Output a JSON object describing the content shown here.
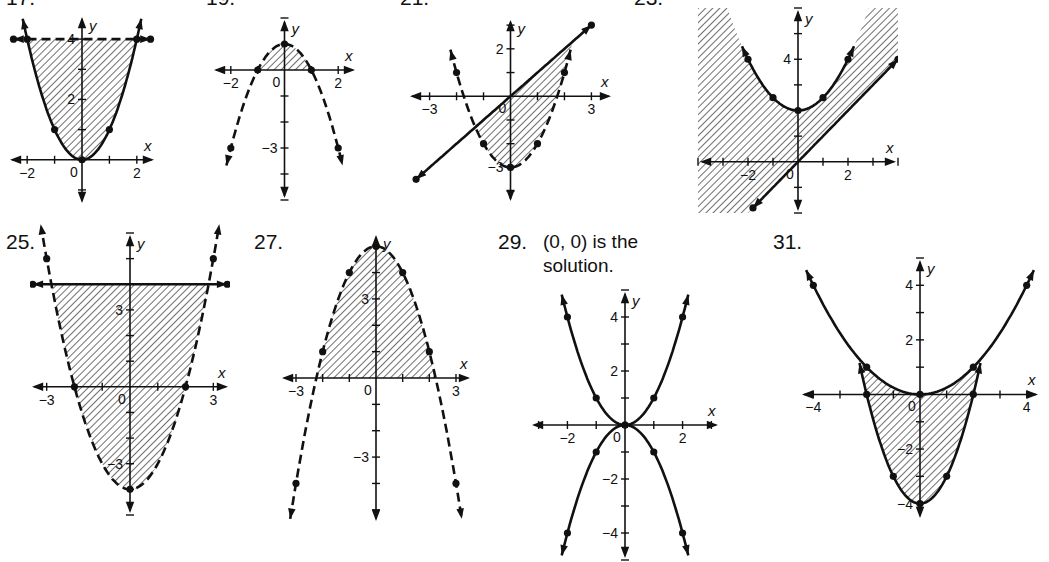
{
  "chart_data": [
    {
      "id": "17",
      "label": "17.",
      "type": "line",
      "title": "",
      "xlabel": "x",
      "ylabel": "y",
      "x_ticks": [
        "-2",
        "0",
        "2"
      ],
      "y_ticks": [
        "2",
        "4"
      ],
      "xlim": [
        -2.7,
        2.7
      ],
      "ylim": [
        -1.5,
        4.8
      ],
      "series": [
        {
          "name": "y = x^2",
          "style": "solid",
          "points": [
            [
              -2,
              4
            ],
            [
              -1,
              1
            ],
            [
              0,
              0
            ],
            [
              1,
              1
            ],
            [
              2,
              4
            ]
          ]
        },
        {
          "name": "y = 4",
          "style": "dashed",
          "points": [
            [
              -2.5,
              4
            ],
            [
              2.5,
              4
            ]
          ]
        }
      ],
      "shaded": "between parabola and y=4",
      "grid": false
    },
    {
      "id": "19",
      "label": "19.",
      "type": "line",
      "xlabel": "x",
      "ylabel": "y",
      "x_ticks": [
        "-2",
        "0",
        "2"
      ],
      "y_ticks": [
        "-3"
      ],
      "xlim": [
        -2.7,
        2.7
      ],
      "ylim": [
        -5,
        2
      ],
      "series": [
        {
          "name": "y = 1 - x^2",
          "style": "dashed",
          "points": [
            [
              -2,
              -3
            ],
            [
              -1,
              0
            ],
            [
              0,
              1
            ],
            [
              1,
              0
            ],
            [
              2,
              -3
            ]
          ]
        }
      ],
      "shaded": "between parabola and x-axis (above)",
      "grid": false
    },
    {
      "id": "21",
      "label": "21.",
      "type": "line",
      "xlabel": "x",
      "ylabel": "y",
      "x_ticks": [
        "-3",
        "0",
        "3"
      ],
      "y_ticks": [
        "2",
        "-3"
      ],
      "xlim": [
        -3.8,
        3.8
      ],
      "ylim": [
        -4.5,
        3.3
      ],
      "series": [
        {
          "name": "y = x^2 - 3",
          "style": "dashed",
          "points": [
            [
              -2,
              1
            ],
            [
              -1,
              -2
            ],
            [
              0,
              -3
            ],
            [
              1,
              -2
            ],
            [
              2,
              1
            ]
          ]
        },
        {
          "name": "y = x",
          "style": "solid/dashed",
          "points": [
            [
              -3.5,
              -3.5
            ],
            [
              3,
              3
            ]
          ]
        }
      ],
      "shaded": "above parabola, below line",
      "grid": false
    },
    {
      "id": "23",
      "label": "23.",
      "type": "line",
      "xlabel": "x",
      "ylabel": "y",
      "x_ticks": [
        "-2",
        "0",
        "2"
      ],
      "y_ticks": [
        "4"
      ],
      "xlim": [
        -4,
        4
      ],
      "ylim": [
        -2,
        6
      ],
      "series": [
        {
          "name": "y = x^2/2 + 2",
          "style": "solid",
          "points": [
            [
              -2,
              4
            ],
            [
              -1,
              2.5
            ],
            [
              0,
              2
            ],
            [
              1,
              2.5
            ],
            [
              2,
              4
            ]
          ]
        },
        {
          "name": "y = x",
          "style": "solid",
          "points": [
            [
              -1.8,
              -1.8
            ],
            [
              4,
              4
            ]
          ]
        }
      ],
      "shaded": "outside parabola and above line (large region)",
      "grid": false
    },
    {
      "id": "25",
      "label": "25.",
      "type": "line",
      "xlabel": "x",
      "ylabel": "y",
      "x_ticks": [
        "-3",
        "0",
        "3"
      ],
      "y_ticks": [
        "3",
        "-3"
      ],
      "xlim": [
        -3.6,
        3.6
      ],
      "ylim": [
        -5,
        6
      ],
      "series": [
        {
          "name": "y = x^2 - 4",
          "style": "dashed",
          "points": [
            [
              -3,
              5
            ],
            [
              -2,
              0
            ],
            [
              0,
              -4
            ],
            [
              2,
              0
            ],
            [
              3,
              5
            ]
          ]
        },
        {
          "name": "y = 4",
          "style": "solid",
          "points": [
            [
              -3.5,
              4
            ],
            [
              3.5,
              4
            ]
          ]
        }
      ],
      "shaded": "above parabola, below y=4",
      "grid": false
    },
    {
      "id": "27",
      "label": "27.",
      "type": "line",
      "xlabel": "x",
      "ylabel": "y",
      "x_ticks": [
        "-3",
        "0",
        "3"
      ],
      "y_ticks": [
        "3",
        "-3"
      ],
      "xlim": [
        -3.6,
        3.6
      ],
      "ylim": [
        -5.5,
        5.5
      ],
      "series": [
        {
          "name": "y = 5 - x^2",
          "style": "dashed",
          "points": [
            [
              -3,
              -4
            ],
            [
              -2,
              1
            ],
            [
              -1,
              4
            ],
            [
              0,
              5
            ],
            [
              1,
              4
            ],
            [
              2,
              1
            ],
            [
              3,
              -4
            ]
          ]
        }
      ],
      "shaded": "below parabola, above x-axis",
      "grid": false
    },
    {
      "id": "29",
      "label": "29.",
      "note": "(0, 0) is the solution.",
      "type": "line",
      "xlabel": "x",
      "ylabel": "y",
      "x_ticks": [
        "-2",
        "0",
        "2"
      ],
      "y_ticks": [
        "4",
        "2",
        "-2",
        "-4"
      ],
      "xlim": [
        -3.3,
        3.3
      ],
      "ylim": [
        -5,
        5
      ],
      "series": [
        {
          "name": "y = x^2",
          "style": "solid",
          "points": [
            [
              -2,
              4
            ],
            [
              -1,
              1
            ],
            [
              0,
              0
            ],
            [
              1,
              1
            ],
            [
              2,
              4
            ]
          ]
        },
        {
          "name": "y = -x^2",
          "style": "solid",
          "points": [
            [
              -2,
              -4
            ],
            [
              -1,
              -1
            ],
            [
              0,
              0
            ],
            [
              1,
              -1
            ],
            [
              2,
              -4
            ]
          ]
        }
      ],
      "shaded": "none",
      "grid": false
    },
    {
      "id": "31",
      "label": "31.",
      "type": "line",
      "xlabel": "x",
      "ylabel": "y",
      "x_ticks": [
        "-4",
        "0",
        "4"
      ],
      "y_ticks": [
        "4",
        "2",
        "-2",
        "-4"
      ],
      "xlim": [
        -4.5,
        4.5
      ],
      "ylim": [
        -4.6,
        5
      ],
      "series": [
        {
          "name": "y = x^2/4",
          "style": "solid",
          "points": [
            [
              -4,
              4
            ],
            [
              -2,
              1
            ],
            [
              0,
              0
            ],
            [
              2,
              1
            ],
            [
              4,
              4
            ]
          ]
        },
        {
          "name": "y = x^2 - 4",
          "style": "solid",
          "points": [
            [
              -2,
              0
            ],
            [
              -1,
              -3
            ],
            [
              0,
              -4
            ],
            [
              1,
              -3
            ],
            [
              2,
              0
            ]
          ]
        }
      ],
      "shaded": "between curves, -2<=x<=2",
      "grid": false
    }
  ]
}
